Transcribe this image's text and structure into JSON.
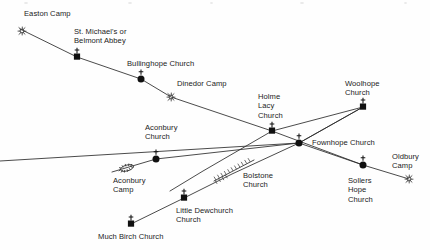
{
  "diagram": {
    "width": 430,
    "height": 250,
    "background_color": "#fefefe",
    "line_color": "#2b2b2b",
    "marker_color": "#111111",
    "text_color": "#1b1b1b"
  },
  "labels": [
    {
      "id": "easton-camp",
      "text": "Easton Camp",
      "x": 24,
      "y": 9,
      "align": "left",
      "lines": [
        "Easton Camp"
      ]
    },
    {
      "id": "st-michaels",
      "text": "St. Michael's or\nBelmont Abbey",
      "x": 74,
      "y": 27,
      "align": "left",
      "lines": [
        "St. Michael's or",
        "Belmont Abbey"
      ]
    },
    {
      "id": "bullinghope",
      "text": "Bullinghope Church",
      "x": 127,
      "y": 59,
      "align": "left",
      "lines": [
        "Bullinghope Church"
      ]
    },
    {
      "id": "dinedor-camp",
      "text": "Dinedor Camp",
      "x": 177,
      "y": 79,
      "align": "left",
      "lines": [
        "Dinedor Camp"
      ]
    },
    {
      "id": "holme-lacy",
      "text": "Holme\nLacy\nChurch",
      "x": 258,
      "y": 92,
      "align": "left",
      "lines": [
        "Holme",
        "Lacy",
        "Church"
      ]
    },
    {
      "id": "woolhope",
      "text": "Woolhope\nChurch",
      "x": 345,
      "y": 79,
      "align": "left",
      "lines": [
        "Woolhope",
        "Church"
      ]
    },
    {
      "id": "aconbury-church",
      "text": "Aconbury\nChurch",
      "x": 145,
      "y": 123,
      "align": "left",
      "lines": [
        "Aconbury",
        "Church"
      ]
    },
    {
      "id": "fownhope",
      "text": "Fownhope Church",
      "x": 312,
      "y": 138,
      "align": "left",
      "lines": [
        "Fownhope Church"
      ]
    },
    {
      "id": "oldbury-camp",
      "text": "Oldbury\nCamp",
      "x": 392,
      "y": 152,
      "align": "left",
      "lines": [
        "Oldbury",
        "Camp"
      ]
    },
    {
      "id": "aconbury-camp",
      "text": "Aconbury\nCamp",
      "x": 113,
      "y": 176,
      "align": "left",
      "lines": [
        "Aconbury",
        "Camp"
      ]
    },
    {
      "id": "bolstone",
      "text": "Bolstone\nChurch",
      "x": 243,
      "y": 171,
      "align": "left",
      "lines": [
        "Bolstone",
        "Church"
      ]
    },
    {
      "id": "sollers-hope",
      "text": "Sollers\nHope\nChurch",
      "x": 348,
      "y": 176,
      "align": "left",
      "lines": [
        "Sollers",
        "Hope",
        "Church"
      ]
    },
    {
      "id": "little-dewchurch",
      "text": "Little Dewchurch\nChurch",
      "x": 176,
      "y": 206,
      "align": "left",
      "lines": [
        "Little Dewchurch",
        "Church"
      ]
    },
    {
      "id": "much-birch",
      "text": "Much Birch Church",
      "x": 98,
      "y": 232,
      "align": "left",
      "lines": [
        "Much Birch Church"
      ]
    }
  ],
  "sites": [
    {
      "id": "easton-camp",
      "name": "Easton Camp",
      "type": "camp",
      "x": 22,
      "y": 31
    },
    {
      "id": "st-michaels",
      "name": "St. Michael's or Belmont Abbey",
      "type": "church-square",
      "x": 77,
      "y": 57
    },
    {
      "id": "bullinghope",
      "name": "Bullinghope Church",
      "type": "church-circle",
      "x": 141,
      "y": 79
    },
    {
      "id": "dinedor-camp",
      "name": "Dinedor Camp",
      "type": "camp",
      "x": 171,
      "y": 97
    },
    {
      "id": "holme-lacy",
      "name": "Holme Lacy Church",
      "type": "church-square",
      "x": 272,
      "y": 131
    },
    {
      "id": "woolhope",
      "name": "Woolhope Church",
      "type": "church-square",
      "x": 363,
      "y": 107
    },
    {
      "id": "aconbury-church",
      "name": "Aconbury Church",
      "type": "church-circle",
      "x": 156,
      "y": 159
    },
    {
      "id": "fownhope",
      "name": "Fownhope Church",
      "type": "church-circle",
      "x": 299,
      "y": 143
    },
    {
      "id": "aconbury-camp",
      "name": "Aconbury Camp",
      "type": "camp-oval",
      "x": 127,
      "y": 168
    },
    {
      "id": "sollers-hope",
      "name": "Sollers Hope Church",
      "type": "church-circle",
      "x": 363,
      "y": 165
    },
    {
      "id": "oldbury-camp",
      "name": "Oldbury Camp",
      "type": "camp",
      "x": 409,
      "y": 179
    },
    {
      "id": "little-dewchurch",
      "name": "Little Dewchurch Church",
      "type": "church-square",
      "x": 184,
      "y": 198
    },
    {
      "id": "much-birch",
      "name": "Much Birch Church",
      "type": "church-square",
      "x": 131,
      "y": 224
    }
  ],
  "alignments": [
    {
      "id": "line-easton-woolhope",
      "description": "Easton Camp - St. Michael's - Bullinghope Church - Dinedor Camp - Holme Lacy Church - Woolhope Church",
      "points": [
        [
          20,
          29
        ],
        [
          77,
          57
        ],
        [
          141,
          79
        ],
        [
          171,
          97
        ],
        [
          272,
          131
        ],
        [
          363,
          107
        ]
      ]
    },
    {
      "id": "line-aconbury-woolhope",
      "description": "Aconbury Church - Fownhope Church - Woolhope Church",
      "points": [
        [
          112,
          172
        ],
        [
          156,
          159
        ],
        [
          299,
          143
        ],
        [
          363,
          107
        ]
      ]
    },
    {
      "id": "line-muchbirch-oldbury",
      "description": "Much Birch Church - Little Dewchurch Church - Bolstone Church - Fownhope Church - Sollers Hope Church - Oldbury Camp",
      "points": [
        [
          131,
          224
        ],
        [
          184,
          198
        ],
        [
          232,
          174
        ],
        [
          299,
          143
        ],
        [
          363,
          165
        ],
        [
          409,
          179
        ]
      ]
    },
    {
      "id": "line-holmelacy-sollers",
      "description": "Holme Lacy Church down to Sollers Hope Church ridge line",
      "points": [
        [
          272,
          131
        ],
        [
          363,
          165
        ]
      ]
    },
    {
      "id": "line-holmelacy-southwest",
      "description": "Line running south-west from Holme Lacy Church past Aconbury",
      "points": [
        [
          272,
          131
        ],
        [
          203,
          171
        ],
        [
          170,
          191
        ]
      ]
    },
    {
      "id": "line-fownhope-west",
      "description": "Westward line through Fownhope Church to left map edge",
      "points": [
        [
          299,
          143
        ],
        [
          0,
          161
        ]
      ]
    },
    {
      "id": "line-fownhope-woolhope-lower",
      "description": "Second line from Fownhope Church up to Woolhope Church",
      "points": [
        [
          299,
          143
        ],
        [
          363,
          107
        ]
      ]
    }
  ],
  "earthwork": {
    "id": "bolstone-earthwork",
    "name": "hatched earthwork near Bolstone Church",
    "start": [
      214,
      181
    ],
    "end": [
      254,
      160
    ]
  },
  "legend_symbols": {
    "church_square": "filled square with cross above",
    "church_circle": "filled circle with cross above",
    "camp": "open hill-fort ring symbol"
  }
}
